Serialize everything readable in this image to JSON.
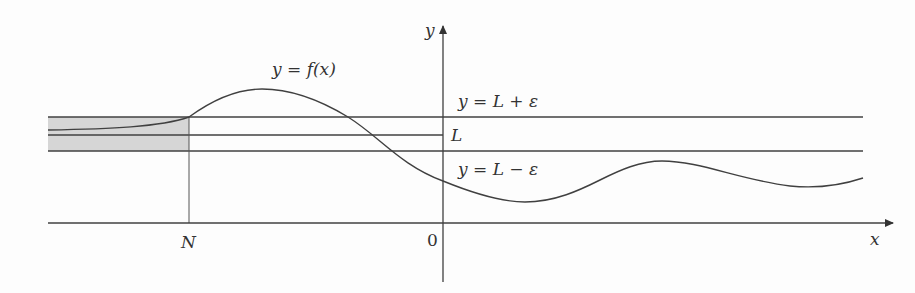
{
  "figure": {
    "curve_label": "y = f(x)",
    "upper_line_label": "y = L + ε",
    "limit_label": "L",
    "lower_line_label": "y = L − ε",
    "x_axis_label": "x",
    "y_axis_label": "y",
    "origin_label": "0",
    "n_label": "N",
    "colors": {
      "stroke": "#404040",
      "shade": "#d3d3d3",
      "background": "#fdfdfd"
    }
  }
}
